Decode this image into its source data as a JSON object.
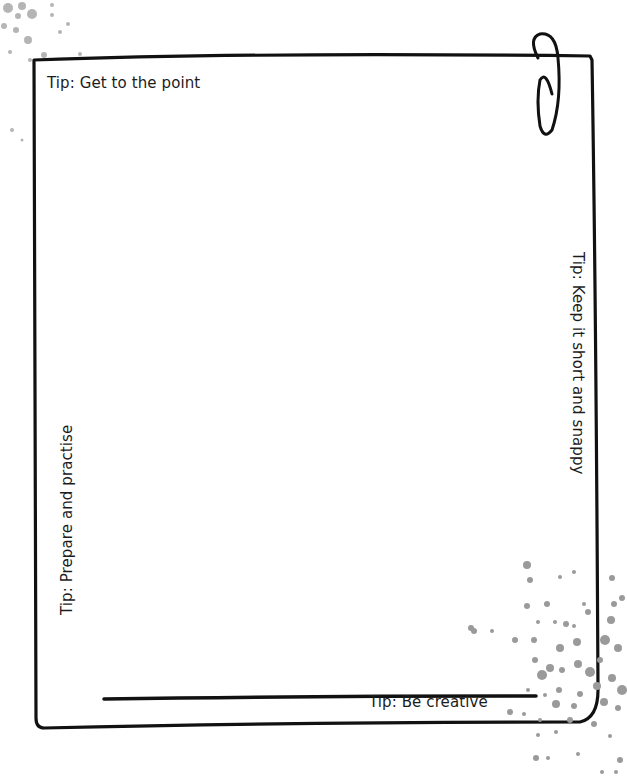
{
  "page": {
    "top_clipped_text": "",
    "background": "#ffffff",
    "frame_color": "#111111",
    "splatter_color": "#9a9a9a"
  },
  "tips": {
    "top": "Tip: Get to the point",
    "right": "Tip: Keep it short and snappy",
    "left": "Tip: Prepare and practise",
    "bottom": "Tip: Be creative"
  },
  "icons": {
    "paperclip": "paperclip-icon",
    "splatter": "paint-splatter-decoration"
  }
}
